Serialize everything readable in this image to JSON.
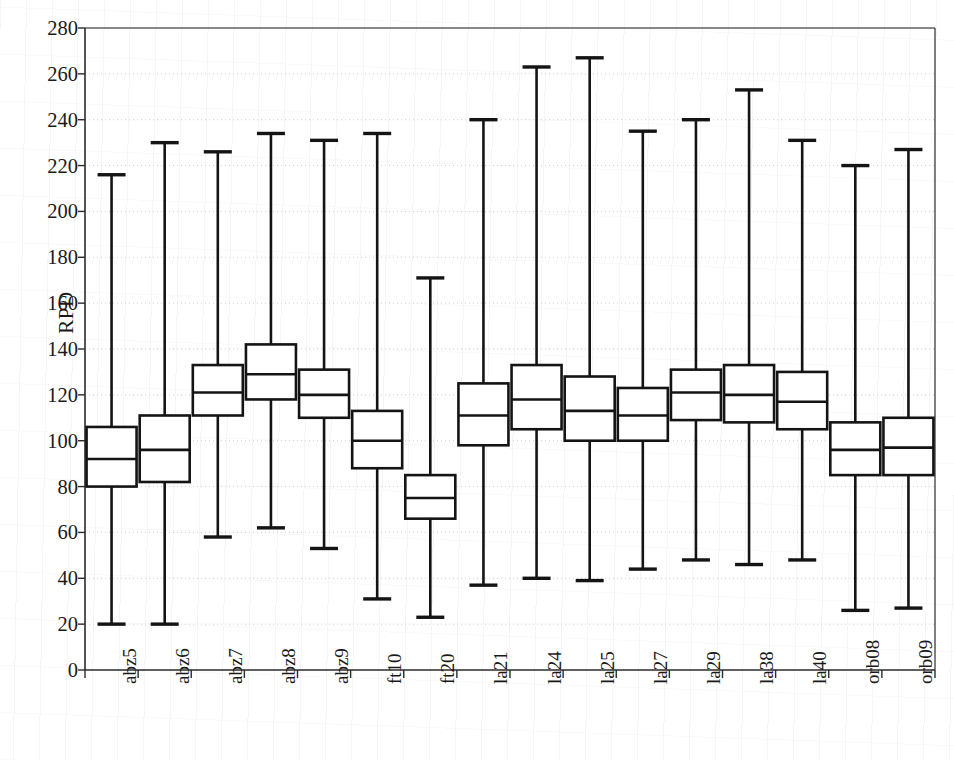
{
  "chart_data": {
    "type": "box",
    "title": "",
    "xlabel": "",
    "ylabel": "RPD",
    "ylim": [
      0,
      280
    ],
    "ytick_step": 20,
    "yticks": [
      0,
      20,
      40,
      60,
      80,
      100,
      120,
      140,
      160,
      180,
      200,
      220,
      240,
      260,
      280
    ],
    "ytick_labels": [
      "0",
      "20",
      "40",
      "60",
      "80",
      "100",
      "120",
      "140",
      "160",
      "180",
      "200",
      "220",
      "240",
      "260",
      "280"
    ],
    "grid": true,
    "legend": "none",
    "categories": [
      "abz5",
      "abz6",
      "abz7",
      "abz8",
      "abz9",
      "ft10",
      "ft20",
      "la21",
      "la24",
      "la25",
      "la27",
      "la29",
      "la38",
      "la40",
      "orb08",
      "orb09"
    ],
    "boxes": [
      {
        "label": "abz5",
        "min": 20,
        "q1": 80,
        "median": 92,
        "q3": 106,
        "max": 216
      },
      {
        "label": "abz6",
        "min": 20,
        "q1": 82,
        "median": 96,
        "q3": 111,
        "max": 230
      },
      {
        "label": "abz7",
        "min": 58,
        "q1": 111,
        "median": 121,
        "q3": 133,
        "max": 226
      },
      {
        "label": "abz8",
        "min": 62,
        "q1": 118,
        "median": 129,
        "q3": 142,
        "max": 234
      },
      {
        "label": "abz9",
        "min": 53,
        "q1": 110,
        "median": 120,
        "q3": 131,
        "max": 231
      },
      {
        "label": "ft10",
        "min": 31,
        "q1": 88,
        "median": 100,
        "q3": 113,
        "max": 234
      },
      {
        "label": "ft20",
        "min": 23,
        "q1": 66,
        "median": 75,
        "q3": 85,
        "max": 171
      },
      {
        "label": "la21",
        "min": 37,
        "q1": 98,
        "median": 111,
        "q3": 125,
        "max": 240
      },
      {
        "label": "la24",
        "min": 40,
        "q1": 105,
        "median": 118,
        "q3": 133,
        "max": 263
      },
      {
        "label": "la25",
        "min": 39,
        "q1": 100,
        "median": 113,
        "q3": 128,
        "max": 267
      },
      {
        "label": "la27",
        "min": 44,
        "q1": 100,
        "median": 111,
        "q3": 123,
        "max": 235
      },
      {
        "label": "la29",
        "min": 48,
        "q1": 109,
        "median": 121,
        "q3": 131,
        "max": 240
      },
      {
        "label": "la38",
        "min": 46,
        "q1": 108,
        "median": 120,
        "q3": 133,
        "max": 253
      },
      {
        "label": "la40",
        "min": 48,
        "q1": 105,
        "median": 117,
        "q3": 130,
        "max": 231
      },
      {
        "label": "orb08",
        "min": 26,
        "q1": 85,
        "median": 96,
        "q3": 108,
        "max": 220
      },
      {
        "label": "orb09",
        "min": 27,
        "q1": 85,
        "median": 97,
        "q3": 110,
        "max": 227
      }
    ],
    "style": {
      "line_color": "#141414",
      "box_fill": "#ffffff",
      "grid_color": "#cfcfcf",
      "axis_color": "#2b2b2b",
      "background": "#ffffff"
    }
  }
}
